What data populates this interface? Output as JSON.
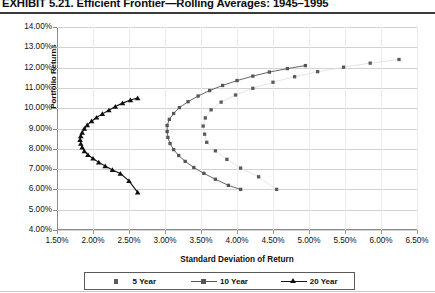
{
  "title": "EXHIBIT 5.21. Efficient Frontier—Rolling Averages: 1945–1995",
  "axes": {
    "xlabel": "Standard Deviation of Return",
    "ylabel": "Portfolio Returns",
    "xticks": [
      "1.50%",
      "2.00%",
      "2.50%",
      "3.00%",
      "3.50%",
      "4.00%",
      "4.50%",
      "5.00%",
      "5.50%",
      "6.00%",
      "6.50%"
    ],
    "yticks": [
      "14.00%",
      "13.00%",
      "12.00%",
      "11.00%",
      "10.00%",
      "9.00%",
      "8.00%",
      "7.00%",
      "6.00%",
      "5.00%",
      "4.00%"
    ]
  },
  "legend": [
    {
      "label": "5 Year",
      "marker": "square",
      "line": false,
      "color": "#5b5b5b"
    },
    {
      "label": "10 Year",
      "marker": "square",
      "line": true,
      "color": "#555555"
    },
    {
      "label": "20 Year",
      "marker": "triangle",
      "line": true,
      "color": "#111111"
    }
  ],
  "chart_data": {
    "type": "scatter",
    "title": "EXHIBIT 5.21. Efficient Frontier—Rolling Averages: 1945–1995",
    "xlabel": "Standard Deviation of Return",
    "ylabel": "Portfolio Returns",
    "xlim": [
      1.5,
      6.5
    ],
    "ylim": [
      4.0,
      14.0
    ],
    "xtick_step": 0.5,
    "ytick_step": 1.0,
    "grid": "horizontal",
    "legend_position": "bottom",
    "units": "percent",
    "series": [
      {
        "name": "20 Year",
        "marker": "triangle",
        "line": true,
        "color": "#111111",
        "points": [
          [
            2.62,
            10.5
          ],
          [
            2.52,
            10.4
          ],
          [
            2.41,
            10.25
          ],
          [
            2.31,
            10.08
          ],
          [
            2.22,
            9.9
          ],
          [
            2.13,
            9.72
          ],
          [
            2.05,
            9.54
          ],
          [
            1.98,
            9.36
          ],
          [
            1.92,
            9.17
          ],
          [
            1.88,
            8.99
          ],
          [
            1.85,
            8.8
          ],
          [
            1.83,
            8.62
          ],
          [
            1.82,
            8.44
          ],
          [
            1.83,
            8.25
          ],
          [
            1.85,
            8.07
          ],
          [
            1.88,
            7.88
          ],
          [
            1.93,
            7.7
          ],
          [
            2.0,
            7.52
          ],
          [
            2.08,
            7.33
          ],
          [
            2.17,
            7.15
          ],
          [
            2.27,
            6.96
          ],
          [
            2.38,
            6.78
          ],
          [
            2.5,
            6.42
          ],
          [
            2.62,
            5.85
          ]
        ]
      },
      {
        "name": "10 Year",
        "marker": "square",
        "line": true,
        "color": "#555555",
        "points": [
          [
            4.95,
            12.1
          ],
          [
            4.7,
            11.95
          ],
          [
            4.45,
            11.78
          ],
          [
            4.22,
            11.58
          ],
          [
            4.0,
            11.36
          ],
          [
            3.8,
            11.12
          ],
          [
            3.62,
            10.87
          ],
          [
            3.46,
            10.6
          ],
          [
            3.32,
            10.32
          ],
          [
            3.2,
            10.03
          ],
          [
            3.12,
            9.74
          ],
          [
            3.06,
            9.45
          ],
          [
            3.03,
            9.15
          ],
          [
            3.03,
            8.85
          ],
          [
            3.04,
            8.56
          ],
          [
            3.07,
            8.26
          ],
          [
            3.12,
            7.96
          ],
          [
            3.19,
            7.67
          ],
          [
            3.28,
            7.38
          ],
          [
            3.4,
            7.08
          ],
          [
            3.54,
            6.79
          ],
          [
            3.7,
            6.5
          ],
          [
            3.88,
            6.2
          ],
          [
            4.05,
            6.0
          ]
        ]
      },
      {
        "name": "5 Year",
        "marker": "square",
        "line": false,
        "color": "#5b5b5b",
        "points": [
          [
            6.25,
            12.4
          ],
          [
            5.85,
            12.22
          ],
          [
            5.48,
            12.02
          ],
          [
            5.12,
            11.8
          ],
          [
            4.8,
            11.55
          ],
          [
            4.5,
            11.28
          ],
          [
            4.22,
            10.98
          ],
          [
            3.98,
            10.65
          ],
          [
            3.78,
            10.3
          ],
          [
            3.64,
            9.92
          ],
          [
            3.56,
            9.52
          ],
          [
            3.53,
            9.12
          ],
          [
            3.55,
            8.72
          ],
          [
            3.58,
            8.32
          ],
          [
            3.7,
            7.9
          ],
          [
            3.86,
            7.48
          ],
          [
            4.05,
            7.05
          ],
          [
            4.3,
            6.62
          ],
          [
            4.55,
            6.0
          ]
        ]
      }
    ]
  }
}
